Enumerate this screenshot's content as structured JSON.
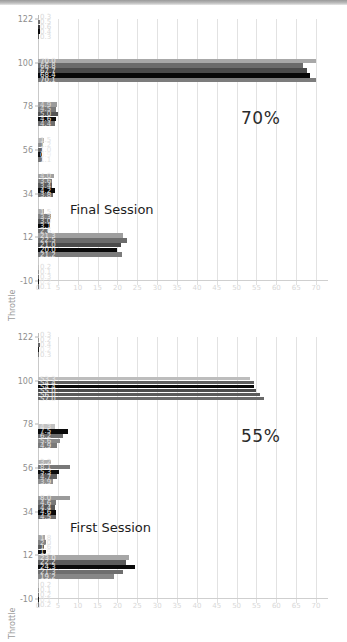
{
  "figure": {
    "background": "#ffffff",
    "topbar_color": "#b0b0b0"
  },
  "chart_data": {
    "type": "bar",
    "orientation": "horizontal",
    "title": "",
    "xlabel": "",
    "ylabel": "Throttle",
    "xlim": [
      0,
      73
    ],
    "ylim": [
      -10,
      122
    ],
    "grid": true,
    "legend": false,
    "xticks": [
      0,
      5,
      10,
      15,
      20,
      25,
      30,
      35,
      40,
      45,
      50,
      55,
      60,
      65,
      70
    ],
    "yticks": [
      -10,
      12,
      34,
      56,
      78,
      100,
      122
    ],
    "panels": [
      {
        "name": "final-session",
        "annotation_percent": "70%",
        "session_label": "Final Session",
        "groups": [
          {
            "center": 118,
            "bars": [
              {
                "value": 0.3,
                "color": "#b9b9b9",
                "label": "0.3",
                "label_color": "#d8d8d8"
              },
              {
                "value": 0.5,
                "color": "#6f6f6f",
                "label": "0.5",
                "label_color": "#d8d8d8"
              },
              {
                "value": 0.6,
                "color": "#3a3a3a",
                "label": "0.6",
                "label_color": "#d8d8d8"
              },
              {
                "value": 0.4,
                "color": "#0a0a0a",
                "label": "0.4",
                "label_color": "#d8d8d8"
              },
              {
                "value": 0.3,
                "color": "#5a5a5a",
                "label": "0.3",
                "label_color": "#d8d8d8"
              }
            ]
          },
          {
            "center": 96,
            "bars": [
              {
                "value": 70.0,
                "color": "#a8a8a8",
                "label": "70.0",
                "label_color": "#e9e9e9"
              },
              {
                "value": 66.8,
                "color": "#6b6b6b",
                "label": "66.8",
                "label_color": "#e9e9e9"
              },
              {
                "value": 67.7,
                "color": "#4a4a4a",
                "label": "67.7",
                "label_color": "#e9e9e9"
              },
              {
                "value": 68.4,
                "color": "#070707",
                "label": "68.4",
                "label_color": "#f2f2f2"
              },
              {
                "value": 70.1,
                "color": "#7c7c7c",
                "label": "70.1",
                "label_color": "#efefef"
              }
            ]
          },
          {
            "center": 74,
            "bars": [
              {
                "value": 4.9,
                "color": "#9b9b9b",
                "label": "4.9",
                "label_color": "#dcdcdc"
              },
              {
                "value": 4.5,
                "color": "#7a7a7a",
                "label": "4.5",
                "label_color": "#dcdcdc"
              },
              {
                "value": 5.0,
                "color": "#555555",
                "label": "5.0",
                "label_color": "#dcdcdc"
              },
              {
                "value": 4.6,
                "color": "#0d0d0d",
                "label": "4.6",
                "label_color": "#f0f0f0"
              },
              {
                "value": 4.4,
                "color": "#6e6e6e",
                "label": "4.4",
                "label_color": "#dcdcdc"
              }
            ]
          },
          {
            "center": 56,
            "bars": [
              {
                "value": 1.5,
                "color": "#b5b5b5",
                "label": "1.5",
                "label_color": "#e2e2e2"
              },
              {
                "value": 1.2,
                "color": "#8d8d8d",
                "label": "1.2",
                "label_color": "#e2e2e2"
              },
              {
                "value": 1.0,
                "color": "#636363",
                "label": "1.0",
                "label_color": "#e2e2e2"
              },
              {
                "value": 0.9,
                "color": "#121212",
                "label": "0.9",
                "label_color": "#efefef"
              },
              {
                "value": 1.1,
                "color": "#757575",
                "label": "1.1",
                "label_color": "#e2e2e2"
              }
            ]
          },
          {
            "center": 38,
            "bars": [
              {
                "value": 4.0,
                "color": "#a0a0a0",
                "label": "4.0",
                "label_color": "#dedede"
              },
              {
                "value": 3.6,
                "color": "#7f7f7f",
                "label": "3.6",
                "label_color": "#dedede"
              },
              {
                "value": 3.4,
                "color": "#5c5c5c",
                "label": "3.4",
                "label_color": "#dedede"
              },
              {
                "value": 4.2,
                "color": "#0a0a0a",
                "label": "4.2",
                "label_color": "#f0f0f0"
              },
              {
                "value": 3.8,
                "color": "#6c6c6c",
                "label": "3.8",
                "label_color": "#dedede"
              }
            ]
          },
          {
            "center": 20,
            "bars": [
              {
                "value": 1.5,
                "color": "#aaaaaa",
                "label": "1.5",
                "label_color": "#e0e0e0"
              },
              {
                "value": 3.3,
                "color": "#828282",
                "label": "3.3",
                "label_color": "#e0e0e0"
              },
              {
                "value": 3.0,
                "color": "#545454",
                "label": "3.0",
                "label_color": "#e0e0e0"
              },
              {
                "value": 3.1,
                "color": "#080808",
                "label": "3.1",
                "label_color": "#f0f0f0"
              },
              {
                "value": 2.6,
                "color": "#707070",
                "label": "2.6",
                "label_color": "#e0e0e0"
              }
            ]
          },
          {
            "center": 8,
            "bars": [
              {
                "value": 21.3,
                "color": "#9e9e9e",
                "label": "21.3",
                "label_color": "#e4e4e4"
              },
              {
                "value": 22.5,
                "color": "#6c6c6c",
                "label": "22.5",
                "label_color": "#e4e4e4"
              },
              {
                "value": 21.0,
                "color": "#4b4b4b",
                "label": "21.0",
                "label_color": "#e4e4e4"
              },
              {
                "value": 20.0,
                "color": "#080808",
                "label": "20.0",
                "label_color": "#f4f4f4"
              },
              {
                "value": 21.2,
                "color": "#7b7b7b",
                "label": "21.2",
                "label_color": "#e8e8e8"
              }
            ]
          },
          {
            "center": -8,
            "bars": [
              {
                "value": 0.2,
                "color": "#bdbdbd",
                "label": "0.2",
                "label_color": "#dcdcdc"
              },
              {
                "value": 0.1,
                "color": "#949494",
                "label": "0.1",
                "label_color": "#dcdcdc"
              },
              {
                "value": 0.3,
                "color": "#6a6a6a",
                "label": "0.3",
                "label_color": "#dcdcdc"
              },
              {
                "value": 0.2,
                "color": "#141414",
                "label": "0.2",
                "label_color": "#e8e8e8"
              },
              {
                "value": 0.1,
                "color": "#787878",
                "label": "0.1",
                "label_color": "#dcdcdc"
              }
            ]
          }
        ]
      },
      {
        "name": "first-session",
        "annotation_percent": "55%",
        "session_label": "First Session",
        "groups": [
          {
            "center": 118,
            "bars": [
              {
                "value": 0.3,
                "color": "#bbbbbb",
                "label": "0.3",
                "label_color": "#dadada"
              },
              {
                "value": 0.2,
                "color": "#929292",
                "label": "0.2",
                "label_color": "#dadada"
              },
              {
                "value": 0.4,
                "color": "#666666",
                "label": "0.4",
                "label_color": "#dadada"
              },
              {
                "value": 0.2,
                "color": "#161616",
                "label": "0.2",
                "label_color": "#e6e6e6"
              },
              {
                "value": 0.3,
                "color": "#7a7a7a",
                "label": "0.3",
                "label_color": "#dadada"
              }
            ]
          },
          {
            "center": 96,
            "bars": [
              {
                "value": 53.3,
                "color": "#bdbdbd",
                "label": "53.3",
                "label_color": "#ededed"
              },
              {
                "value": 54.4,
                "color": "#5f5f5f",
                "label": "54.4",
                "label_color": "#ededed"
              },
              {
                "value": 54.4,
                "color": "#090909",
                "label": "54.4",
                "label_color": "#f4f4f4"
              },
              {
                "value": 55.0,
                "color": "#4d4d4d",
                "label": "55.0",
                "label_color": "#ededed"
              },
              {
                "value": 56.0,
                "color": "#5b5b5b",
                "label": "56.0",
                "label_color": "#ededed"
              },
              {
                "value": 57.0,
                "color": "#696969",
                "label": "57.0",
                "label_color": "#ededed"
              }
            ]
          },
          {
            "center": 72,
            "bars": [
              {
                "value": 4.3,
                "color": "#c2c2c2",
                "label": "4.3",
                "label_color": "#e4e4e4"
              },
              {
                "value": 7.5,
                "color": "#0a0a0a",
                "label": "7.5",
                "label_color": "#f0f0f0"
              },
              {
                "value": 6.2,
                "color": "#6e6e6e",
                "label": "6.2",
                "label_color": "#e4e4e4"
              },
              {
                "value": 5.6,
                "color": "#8a8a8a",
                "label": "5.6",
                "label_color": "#e4e4e4"
              },
              {
                "value": 4.9,
                "color": "#7a7a7a",
                "label": "4.9",
                "label_color": "#e4e4e4"
              }
            ]
          },
          {
            "center": 54,
            "bars": [
              {
                "value": 3.2,
                "color": "#b0b0b0",
                "label": "3.2",
                "label_color": "#e0e0e0"
              },
              {
                "value": 8.1,
                "color": "#787878",
                "label": "8.1",
                "label_color": "#e0e0e0"
              },
              {
                "value": 5.3,
                "color": "#0c0c0c",
                "label": "5.3",
                "label_color": "#f0f0f0"
              },
              {
                "value": 4.7,
                "color": "#5e5e5e",
                "label": "4.7",
                "label_color": "#e0e0e0"
              },
              {
                "value": 3.9,
                "color": "#8e8e8e",
                "label": "3.9",
                "label_color": "#e0e0e0"
              }
            ]
          },
          {
            "center": 36,
            "bars": [
              {
                "value": 8.0,
                "color": "#9a9a9a",
                "label": "8.0",
                "label_color": "#e6e6e6"
              },
              {
                "value": 4.6,
                "color": "#787878",
                "label": "4.6",
                "label_color": "#e6e6e6"
              },
              {
                "value": 4.4,
                "color": "#565656",
                "label": "4.4",
                "label_color": "#e6e6e6"
              },
              {
                "value": 4.6,
                "color": "#0a0a0a",
                "label": "4.6",
                "label_color": "#f0f0f0"
              },
              {
                "value": 4.5,
                "color": "#6d6d6d",
                "label": "4.5",
                "label_color": "#e6e6e6"
              }
            ]
          },
          {
            "center": 16,
            "bars": [
              {
                "value": 1.8,
                "color": "#a6a6a6",
                "label": "1.8",
                "label_color": "#e0e0e0"
              },
              {
                "value": 2.0,
                "color": "#838383",
                "label": "2.0",
                "label_color": "#e0e0e0"
              },
              {
                "value": 1.6,
                "color": "#5a5a5a",
                "label": "1.6",
                "label_color": "#e0e0e0"
              },
              {
                "value": 1.9,
                "color": "#101010",
                "label": "1.9",
                "label_color": "#ececec"
              },
              {
                "value": 1.5,
                "color": "#747474",
                "label": "1.5",
                "label_color": "#e0e0e0"
              }
            ]
          },
          {
            "center": 6,
            "bars": [
              {
                "value": 23.0,
                "color": "#a6a6a6",
                "label": "23.0",
                "label_color": "#e8e8e8"
              },
              {
                "value": 22.2,
                "color": "#5c5c5c",
                "label": "22.2",
                "label_color": "#e8e8e8"
              },
              {
                "value": 24.3,
                "color": "#0a0a0a",
                "label": "24.3",
                "label_color": "#f4f4f4"
              },
              {
                "value": 21.3,
                "color": "#6e6e6e",
                "label": "21.3",
                "label_color": "#e8e8e8"
              },
              {
                "value": 19.2,
                "color": "#878787",
                "label": "19.2",
                "label_color": "#e8e8e8"
              }
            ]
          },
          {
            "center": -8,
            "bars": [
              {
                "value": 0.2,
                "color": "#c0c0c0",
                "label": "0.2",
                "label_color": "#dadada"
              },
              {
                "value": 0.1,
                "color": "#9a9a9a",
                "label": "0.1",
                "label_color": "#dadada"
              },
              {
                "value": 0.2,
                "color": "#707070",
                "label": "0.2",
                "label_color": "#dadada"
              },
              {
                "value": 0.1,
                "color": "#1a1a1a",
                "label": "0.1",
                "label_color": "#e4e4e4"
              },
              {
                "value": 0.2,
                "color": "#808080",
                "label": "0.2",
                "label_color": "#dadada"
              }
            ]
          }
        ]
      }
    ]
  }
}
